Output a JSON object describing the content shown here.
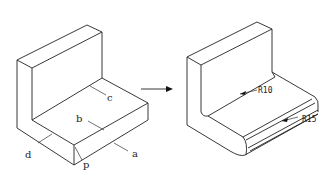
{
  "diagram": {
    "left_block": {
      "edge_labels": [
        {
          "id": "a",
          "text": "a"
        },
        {
          "id": "b",
          "text": "b"
        },
        {
          "id": "c",
          "text": "c"
        },
        {
          "id": "d",
          "text": "d"
        },
        {
          "id": "p",
          "text": "p"
        }
      ]
    },
    "arrow": {
      "direction": "right"
    },
    "right_block": {
      "dimensions": [
        {
          "id": "r10",
          "text": "R10"
        },
        {
          "id": "r15",
          "text": "R15"
        }
      ]
    },
    "colors": {
      "line": "#222222",
      "background": "#ffffff"
    }
  }
}
